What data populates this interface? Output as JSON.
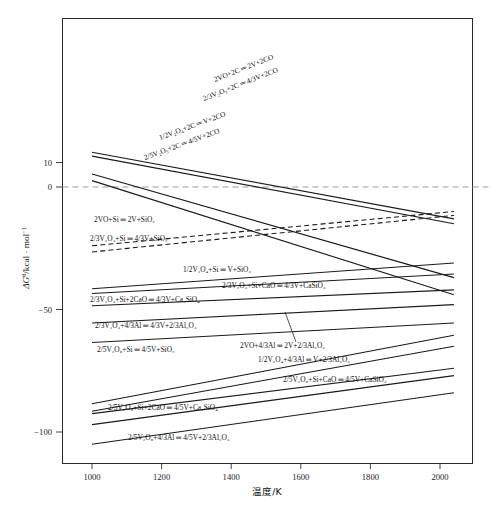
{
  "chart_data": {
    "type": "line",
    "title": "",
    "xlabel": "温度/K",
    "ylabel": "ΔG /kcal · mol",
    "ylabel_parts": {
      "delta_g": "ΔG",
      "superscript": "θ",
      "units": "/kcal · mol",
      "unit_exponent": "−1"
    },
    "xlim": [
      950,
      2060
    ],
    "ylim": [
      -118,
      16
    ],
    "xticks": [
      1000,
      1200,
      1400,
      1600,
      1800,
      2000
    ],
    "yticks": [
      10,
      0,
      -50,
      -100
    ],
    "ytick_labels": [
      "10",
      "0",
      "−50",
      "−100"
    ],
    "grid": false,
    "zero_reference_line": {
      "value": 0,
      "style": "dashed",
      "color": "#9a9a9a"
    },
    "legend": "inline-labels-on-curves",
    "series": [
      {
        "name": "2VO+2C = 2V+2CO",
        "style": "solid",
        "label_rotated": true,
        "x": [
          1000,
          2040
        ],
        "y": [
          14.2,
          -13.0
        ]
      },
      {
        "name": "2/3V2O3+2C = 4/3V+2CO",
        "style": "solid",
        "label_rotated": true,
        "x": [
          1000,
          2040
        ],
        "y": [
          12.6,
          -15.0
        ]
      },
      {
        "name": "1/2V2O4+2C = V+2CO",
        "style": "solid",
        "label_rotated": true,
        "x": [
          1000,
          2040
        ],
        "y": [
          5.3,
          -37.0
        ]
      },
      {
        "name": "2/5V2O5+2C = 4/5V+2CO",
        "style": "solid",
        "label_rotated": true,
        "x": [
          1000,
          2040
        ],
        "y": [
          2.6,
          -44.0
        ]
      },
      {
        "name": "2VO+Si = 2V+SiO2",
        "style": "dashed",
        "label_rotated": false,
        "x": [
          1000,
          2040
        ],
        "y": [
          -24.0,
          -10.0
        ]
      },
      {
        "name": "2/3V2O3+Si = 4/3V+SiO2",
        "style": "dashed",
        "label_rotated": false,
        "x": [
          1000,
          2040
        ],
        "y": [
          -26.5,
          -11.6
        ]
      },
      {
        "name": "1/2V2O4+Si = V+SiO2",
        "style": "solid",
        "label_rotated": false,
        "x": [
          1000,
          2040
        ],
        "y": [
          -41.5,
          -31.0
        ]
      },
      {
        "name": "2/3V2O3+Si+CaO = 4/3V+CaSiO3",
        "style": "solid",
        "label_rotated": false,
        "x": [
          1000,
          2040
        ],
        "y": [
          -43.5,
          -35.5
        ]
      },
      {
        "name": "2/3V2O3+Si+2CaO = 4/3V+Ca2SiO4",
        "style": "solid",
        "label_rotated": false,
        "x": [
          1000,
          2040
        ],
        "y": [
          -48.5,
          -42.0
        ]
      },
      {
        "name": "2/3V2O3+4/3Al = 4/3V+2/3Al2O3",
        "style": "solid",
        "label_rotated": false,
        "x": [
          1000,
          2040
        ],
        "y": [
          -55.5,
          -48.0
        ]
      },
      {
        "name": "2/5V2O5+Si = 4/5V+SiO2",
        "style": "solid",
        "label_rotated": false,
        "x": [
          1000,
          2040
        ],
        "y": [
          -63.5,
          -55.5
        ]
      },
      {
        "name": "2VO+4/3Al = 2V+2/3Al2O3",
        "style": "solid",
        "label_rotated": false,
        "x": [
          1000,
          2040
        ],
        "y": [
          -88.5,
          -60.5
        ]
      },
      {
        "name": "1/2V2O4+4/3Al = V+2/3Al2O3",
        "style": "solid",
        "label_rotated": false,
        "x": [
          1000,
          2040
        ],
        "y": [
          -91.5,
          -65.0
        ]
      },
      {
        "name": "2/5V2O5+Si+CaO = 4/5V+CaSiO3",
        "style": "solid",
        "label_rotated": false,
        "x": [
          1000,
          2040
        ],
        "y": [
          -92.5,
          -74.0
        ]
      },
      {
        "name": "2/5V2O5+Si+2CaO = 4/5V+Ca2SiO4",
        "style": "solid",
        "label_rotated": false,
        "x": [
          1000,
          2040
        ],
        "y": [
          -97.0,
          -77.0
        ]
      },
      {
        "name": "2/5V2O5+4/3Al = 4/5V+2/3Al2O3",
        "style": "solid",
        "label_rotated": false,
        "x": [
          1000,
          2040
        ],
        "y": [
          -105.0,
          -84.0
        ]
      }
    ],
    "annotations": [
      {
        "id": "a1",
        "text": "2VO+2C ═ 2V+2CO",
        "x": 215,
        "y": 82,
        "rot": -21.5
      },
      {
        "id": "a2",
        "text": "2/3V₂O₃+2C ═ 4/3V+2CO",
        "x": 204,
        "y": 101,
        "rot": -21.5
      },
      {
        "id": "a3",
        "text": "1/2V₂O₄+2C ═ V+2CO",
        "x": 160,
        "y": 140,
        "rot": -20.0
      },
      {
        "id": "a4",
        "text": "2/5V₂O₅+2C ═ 4/5V+2CO",
        "x": 145,
        "y": 160,
        "rot": -20.0
      },
      {
        "id": "a5",
        "text": "2VO+Si ═ 2V+SiO₂",
        "x": 94,
        "y": 222,
        "rot": 0
      },
      {
        "id": "a6",
        "text": "2/3V₂O₃+Si ═ 4/3V+SiO₂",
        "x": 90,
        "y": 241,
        "rot": 0
      },
      {
        "id": "a7",
        "text": "1/2V₂O₄+Si ═ V+SiO₂",
        "x": 183,
        "y": 272,
        "rot": 0
      },
      {
        "id": "a8",
        "text": "2/3V₂O₃+Si+CaO ═ 4/3V+CaSiO₃",
        "x": 222,
        "y": 288,
        "rot": 0
      },
      {
        "id": "a9",
        "text": "2/3V₂O₃+Si+2CaO ═ 4/3V+Ca₂SiO₄",
        "x": 90,
        "y": 302,
        "rot": 0
      },
      {
        "id": "a10",
        "text": "2/3V₂O₃+4/3Al ═ 4/3V+2/3Al₂O₃",
        "x": 95,
        "y": 328,
        "rot": 0
      },
      {
        "id": "a11",
        "text": "2/5V₂O₅+Si ═ 4/5V+SiO₂",
        "x": 97,
        "y": 352,
        "rot": 0
      },
      {
        "id": "a12",
        "text": "2VO+4/3Al ═ 2V+2/3Al₂O₃",
        "x": 240,
        "y": 348,
        "rot": 0
      },
      {
        "id": "a13",
        "text": "1/2V₂O₄+4/3Al ═ V+2/3Al₂O₃",
        "x": 258,
        "y": 362,
        "rot": 0
      },
      {
        "id": "a14",
        "text": "2/5V₂O₅+Si+CaO ═ 4/5V+CaSiO₃",
        "x": 283,
        "y": 382,
        "rot": 0
      },
      {
        "id": "a15",
        "text": "2/5V₂O₅+Si+2CaO ═ 4/5V+Ca₂SiO₄",
        "x": 108,
        "y": 410,
        "rot": 0
      },
      {
        "id": "a16",
        "text": "2/5V₂O₅+4/3Al ═ 4/5V+2/3Al₂O₃",
        "x": 128,
        "y": 440,
        "rot": 0
      }
    ]
  },
  "axes": {
    "x_tick_labels": [
      "1000",
      "1200",
      "1400",
      "1600",
      "1800",
      "2000"
    ],
    "y_tick_labels": [
      "10",
      "0",
      "−50",
      "−100"
    ],
    "x_axis_title": "温度/K"
  }
}
